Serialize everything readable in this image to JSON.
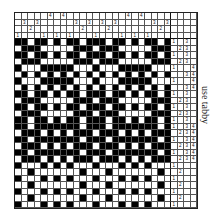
{
  "note": "use tabby",
  "threading": {
    "shafts": 4,
    "sequence": [
      1,
      3,
      2,
      3,
      1,
      4,
      1,
      4,
      1,
      3,
      2,
      3,
      1,
      3,
      2,
      3,
      1,
      4,
      1,
      4,
      1,
      3,
      2,
      3
    ]
  },
  "treadling": {
    "rows": [
      "1 3",
      "2 3",
      "1 3",
      "2 3",
      "1 4",
      "3 4",
      "1 4",
      "3 4",
      "1 3",
      "2 3",
      "1 3",
      "2 3",
      "1 3",
      "1 3 4",
      "2 3 4",
      "1 3 4",
      "2 3 4",
      "1 3 4",
      "2 3 4",
      "1",
      "2",
      "1",
      "2",
      "1",
      "2",
      "1"
    ]
  },
  "colors": {
    "ink": "#000000",
    "paper": "#ffffff",
    "line": "#555555"
  }
}
